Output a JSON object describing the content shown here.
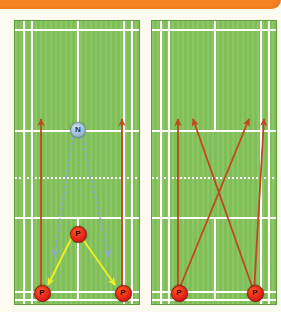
{
  "page": {
    "background_color": "#fdfaf0"
  },
  "top_bar": {
    "name": "orange-banner",
    "color": "#f58220",
    "label": ""
  },
  "colors": {
    "court_surface": "#80bf57",
    "court_border": "#5f9e3f",
    "court_line": "#ffffff",
    "player_marker": "#e8261a",
    "net_marker": "#9fb9d2",
    "red_arrow": "#c0481c",
    "yellow_arrow": "#f2f024",
    "blue_arrow": "#8fa9c6"
  },
  "legend": {
    "player_label": "P",
    "net_label": "N"
  },
  "courts": [
    {
      "id": "court-left",
      "name": "left-court-diagram",
      "markers": [
        {
          "id": "p-center",
          "label": "P",
          "type": "player",
          "x": 63,
          "y": 213
        },
        {
          "id": "p-bottom-left",
          "label": "P",
          "type": "player",
          "x": 27,
          "y": 272
        },
        {
          "id": "p-bottom-right",
          "label": "P",
          "type": "player",
          "x": 108,
          "y": 272
        },
        {
          "id": "n-net",
          "label": "N",
          "type": "net",
          "x": 63,
          "y": 109
        }
      ],
      "arrows": [
        {
          "id": "red-left-up",
          "color": "#c0481c",
          "style": "solid",
          "heads": "end",
          "x1": 27,
          "y1": 272,
          "x2": 27,
          "y2": 99
        },
        {
          "id": "red-right-up",
          "color": "#c0481c",
          "style": "solid",
          "heads": "end",
          "x1": 108,
          "y1": 272,
          "x2": 108,
          "y2": 99
        },
        {
          "id": "yellow-left",
          "color": "#f2f024",
          "style": "solid",
          "heads": "both",
          "x1": 56,
          "y1": 221,
          "x2": 34,
          "y2": 265
        },
        {
          "id": "yellow-right",
          "color": "#f2f024",
          "style": "solid",
          "heads": "both",
          "x1": 70,
          "y1": 221,
          "x2": 101,
          "y2": 265
        },
        {
          "id": "blue-net-left",
          "color": "#8fa9c6",
          "style": "dashed",
          "heads": "end",
          "x1": 59,
          "y1": 117,
          "x2": 40,
          "y2": 237
        },
        {
          "id": "blue-net-right",
          "color": "#8fa9c6",
          "style": "dashed",
          "heads": "end",
          "x1": 68,
          "y1": 117,
          "x2": 95,
          "y2": 237
        }
      ]
    },
    {
      "id": "court-right",
      "name": "right-court-diagram",
      "markers": [
        {
          "id": "p-bottom-left",
          "label": "P",
          "type": "player",
          "x": 27,
          "y": 272
        },
        {
          "id": "p-bottom-right",
          "label": "P",
          "type": "player",
          "x": 103,
          "y": 272
        }
      ],
      "arrows": [
        {
          "id": "red-straight-left",
          "color": "#c0481c",
          "style": "solid",
          "heads": "end",
          "x1": 27,
          "y1": 272,
          "x2": 27,
          "y2": 99
        },
        {
          "id": "red-cross-left",
          "color": "#c0481c",
          "style": "solid",
          "heads": "end",
          "x1": 27,
          "y1": 272,
          "x2": 98,
          "y2": 99
        },
        {
          "id": "red-cross-right",
          "color": "#c0481c",
          "style": "solid",
          "heads": "end",
          "x1": 103,
          "y1": 272,
          "x2": 42,
          "y2": 99
        },
        {
          "id": "red-straight-right",
          "color": "#c0481c",
          "style": "solid",
          "heads": "end",
          "x1": 103,
          "y1": 272,
          "x2": 113,
          "y2": 99
        }
      ]
    }
  ],
  "court_lines": {
    "horizontal": [
      {
        "id": "back-boundary-top",
        "y": 8,
        "style": "solid"
      },
      {
        "id": "net-line",
        "y": 109,
        "style": "solid"
      },
      {
        "id": "short-service-top",
        "y": 156,
        "style": "dotted"
      },
      {
        "id": "short-service-bottom",
        "y": 196,
        "style": "solid"
      },
      {
        "id": "long-service-bottom",
        "y": 270,
        "style": "solid"
      },
      {
        "id": "back-boundary-bottom",
        "y": 278,
        "style": "solid"
      }
    ],
    "vertical": [
      {
        "id": "sideline-left",
        "x": 8,
        "style": "solid"
      },
      {
        "id": "singles-sideline-left",
        "x": 16,
        "style": "solid"
      },
      {
        "id": "centre-line",
        "x": 62,
        "style": "solid"
      },
      {
        "id": "singles-sideline-right",
        "x": 108,
        "style": "solid"
      },
      {
        "id": "sideline-right",
        "x": 116,
        "style": "solid"
      }
    ]
  }
}
